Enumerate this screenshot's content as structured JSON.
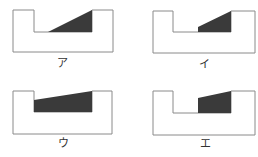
{
  "colors": {
    "outline": "#8a8a8a",
    "fill": "#3a3a3a",
    "background": "#ffffff"
  },
  "panels": [
    {
      "label": "ア",
      "outline": "13,10 34,10 34,32 92,32 92,10 113,10 113,52 13,52",
      "shaded": "48,32 92,10 92,32"
    },
    {
      "label": "イ",
      "outline": "153,11 173,11 173,32 231,32 231,11 255,11 255,53 153,53",
      "shaded": "198,32 198,27 231,11 231,32"
    },
    {
      "label": "ウ",
      "outline": "13,91 34,91 34,112 92,112 92,91 112,91 112,134 13,134",
      "shaded": "34,112 34,100 92,91 92,112"
    },
    {
      "label": "エ",
      "outline": "153,91 173,91 173,113 231,113 231,91 255,91 255,135 153,135",
      "shaded": "198,113 198,98 231,91 231,113"
    }
  ]
}
